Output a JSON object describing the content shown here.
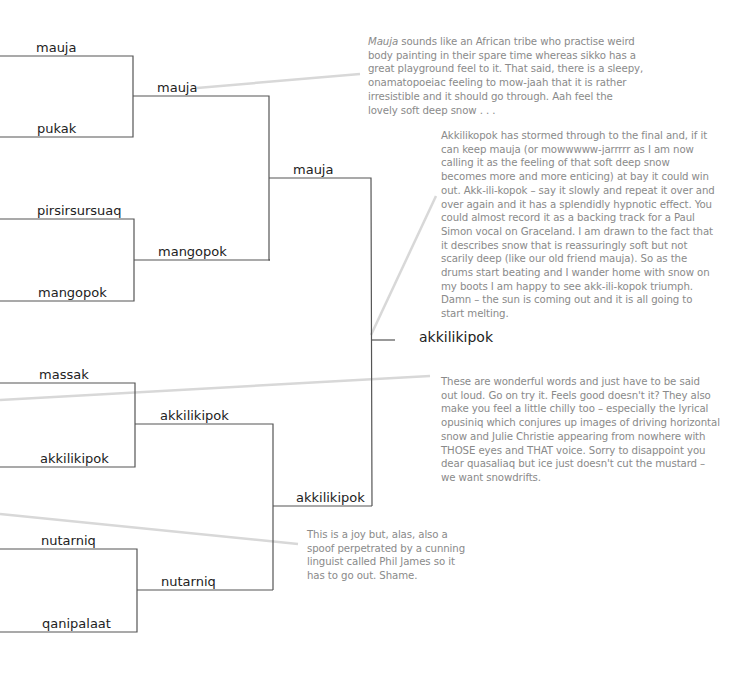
{
  "round1": [
    "mauja",
    "pukak",
    "pirsirsursuaq",
    "mangopok",
    "massak",
    "akkilikipok",
    "nutarniq",
    "qanipalaat"
  ],
  "round2": [
    "mauja",
    "mangopok",
    "akkilikipok",
    "nutarniq"
  ],
  "round3": [
    "mauja",
    "akkilikipok"
  ],
  "winner": "akkilikipok",
  "notes": {
    "mauja": {
      "lines": [
        [
          "Mauja",
          " sounds like an African tribe who practise weird"
        ],
        "body painting in their spare time whereas sikko has a",
        "great playground feel to it. That said, there is a sleepy,",
        "onamatopoeiac feeling to mow-jaah that it is rather",
        "irresistible and it should go through. Aah feel the",
        "lovely soft deep snow . . ."
      ]
    },
    "akkilikipok": {
      "lines": [
        "Akkilikopok has stormed through to the final and, if it",
        "can keep mauja (or mowwwww-jarrrrr as I am now",
        "calling it as the feeling of that soft deep snow",
        "becomes more and more enticing) at bay it could win",
        "out. Akk-ili-kopok – say it slowly and repeat it over and",
        "over again and it has a splendidly hypnotic effect. You",
        "could almost record it as a backing track for a Paul",
        "Simon vocal on Graceland. I am drawn to the fact that",
        "it describes snow that is reassuringly soft but not",
        "scarily deep (like our old friend mauja). So as the",
        "drums start beating and I wander home with snow on",
        "my boots I am happy to see akk-ili-kopok triumph.",
        "Damn – the sun is coming out and it is all going to",
        "start melting."
      ]
    },
    "wonderful": {
      "lines": [
        "These are wonderful words and just have to be said",
        "out loud. Go on try it. Feels good doesn't it? They also",
        "make you feel a little chilly too – especially the lyrical",
        "opusiniq which conjures up images of driving horizontal",
        "snow and Julie Christie appearing from nowhere with",
        "THOSE eyes and THAT voice. Sorry to disappoint you",
        "dear quasaliaq but ice just doesn't cut the mustard –",
        "we want snowdrifts."
      ]
    },
    "spoof": {
      "lines": [
        "This is a joy but, alas, also a",
        "spoof perpetrated by a cunning",
        "linguist called Phil James so it",
        "has to go out. Shame."
      ]
    }
  },
  "colors": {
    "bracket": "#555555",
    "callout": "#d8d8d8",
    "note_text": "#8a8a8a",
    "label": "#222222"
  }
}
